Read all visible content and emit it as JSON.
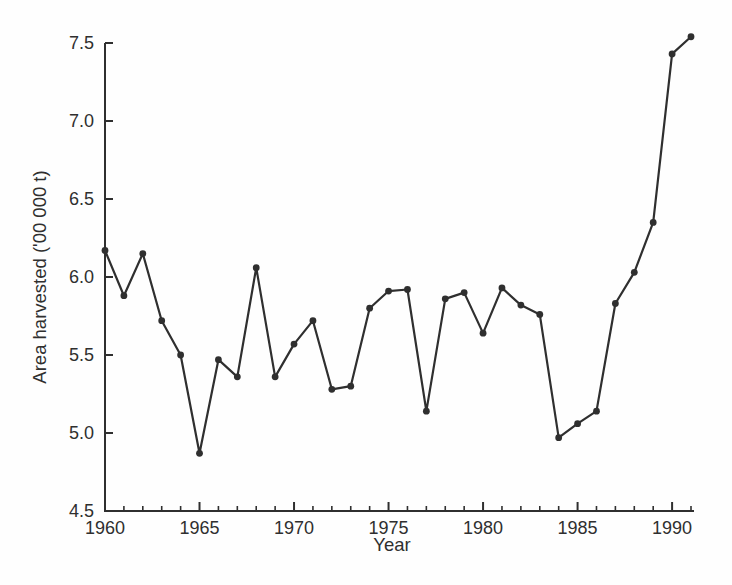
{
  "figure": {
    "background": "#fefefe",
    "ink_color": "#2f2f2f"
  },
  "chart_data": {
    "type": "line",
    "title": "",
    "xlabel": "Year",
    "ylabel": "Area harvested ('00 000 t)",
    "series_name": "Area harvested",
    "x": [
      1960,
      1961,
      1962,
      1963,
      1964,
      1965,
      1966,
      1967,
      1968,
      1969,
      1970,
      1971,
      1972,
      1973,
      1974,
      1975,
      1976,
      1977,
      1978,
      1979,
      1980,
      1981,
      1982,
      1983,
      1984,
      1985,
      1986,
      1987,
      1988,
      1989,
      1990,
      1991
    ],
    "values": [
      6.17,
      5.88,
      6.15,
      5.72,
      5.5,
      4.87,
      5.47,
      5.36,
      6.06,
      5.36,
      5.57,
      5.72,
      5.28,
      5.3,
      5.8,
      5.91,
      5.92,
      5.14,
      5.86,
      5.9,
      5.64,
      5.93,
      5.82,
      5.76,
      4.97,
      5.06,
      5.14,
      5.83,
      6.03,
      6.35,
      7.43,
      7.54
    ],
    "xlim": [
      1960,
      1991
    ],
    "ylim": [
      4.5,
      7.5
    ],
    "yticks": [
      4.5,
      5.0,
      5.5,
      6.0,
      6.5,
      7.0,
      7.5
    ],
    "xticks_major": [
      1960,
      1965,
      1970,
      1975,
      1980,
      1985,
      1990
    ],
    "xticks_minor_interval": 1,
    "grid": false,
    "legend": "none",
    "line_color": "#2f2f2f",
    "marker": "filled-circle",
    "marker_radius": 3.4,
    "line_width": 2.2
  }
}
